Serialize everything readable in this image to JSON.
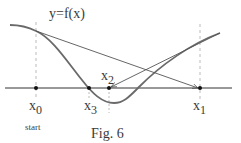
{
  "figure": {
    "function_label": "y=f(x)",
    "caption": "Fig. 6",
    "start_label": "start",
    "points": [
      {
        "name": "x",
        "sub": "0",
        "x": 36
      },
      {
        "name": "x",
        "sub": "1",
        "x": 200
      },
      {
        "name": "x",
        "sub": "2",
        "x": 109
      },
      {
        "name": "x",
        "sub": "3",
        "x": 89
      }
    ],
    "colors": {
      "curve": "#6a6a6a",
      "lines": "#555555",
      "axis": "#333333",
      "dashed": "#aaaaaa",
      "text": "#3a3a3a"
    }
  }
}
